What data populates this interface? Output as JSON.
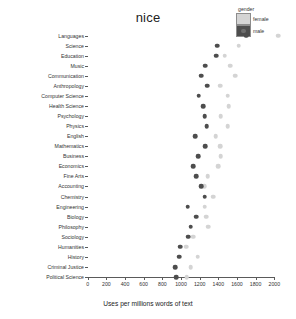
{
  "chart_data": {
    "type": "scatter",
    "title": "nice",
    "xlabel": "Uses per millions words of text",
    "ylabel": "",
    "xlim": [
      0,
      2100
    ],
    "xticks": [
      0,
      200,
      400,
      600,
      800,
      1000,
      1200,
      1400,
      1600,
      1800,
      2000
    ],
    "xticklabels": [
      "0",
      "200",
      "400",
      "600",
      "800",
      "1000",
      "1200",
      "1400",
      "1600",
      "1800",
      "2000"
    ],
    "grid": false,
    "legend": {
      "title": "gender",
      "position": "top-right",
      "entries": [
        {
          "label": "female",
          "color": "#d4d4d4"
        },
        {
          "label": "male",
          "color": "#4d4d4d"
        }
      ]
    },
    "categories": [
      "Languages",
      "Science",
      "Education",
      "Music",
      "Communication",
      "Anthropology",
      "Computer Science",
      "Health Science",
      "Psychology",
      "Physics",
      "English",
      "Mathematics",
      "Business",
      "Economics",
      "Fine Arts",
      "Accounting",
      "Chemistry",
      "Engineering",
      "Biology",
      "Philosophy",
      "Sociology",
      "Humanities",
      "History",
      "Criminal Justice",
      "Political Science"
    ],
    "series": [
      {
        "name": "female",
        "color": "#d4d4d4",
        "values": [
          2040,
          1620,
          1470,
          1530,
          1580,
          1420,
          1500,
          1510,
          1425,
          1500,
          1370,
          1420,
          1425,
          1400,
          1285,
          1250,
          1345,
          1255,
          1270,
          1290,
          1130,
          1055,
          1180,
          1105,
          1060
        ]
      },
      {
        "name": "male",
        "color": "#4d4d4d",
        "values": [
          1700,
          1390,
          1380,
          1260,
          1215,
          1280,
          1190,
          1240,
          1255,
          1275,
          1150,
          1260,
          1185,
          1130,
          1165,
          1215,
          1255,
          1070,
          1165,
          1105,
          1080,
          990,
          980,
          935,
          950
        ]
      }
    ]
  }
}
